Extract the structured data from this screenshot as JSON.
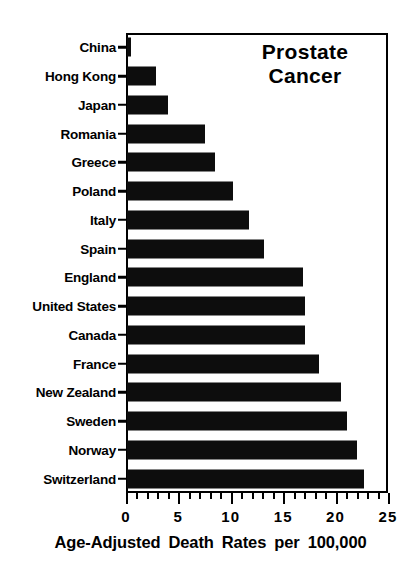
{
  "chart_data": {
    "type": "bar",
    "orientation": "horizontal",
    "title": "Prostate Cancer",
    "title_lines": [
      "Prostate",
      "Cancer"
    ],
    "xlabel": "Age-Adjusted Death Rates per 100,000",
    "ylabel": "",
    "xlim": [
      0,
      25
    ],
    "xticks": [
      0,
      5,
      10,
      15,
      20,
      25
    ],
    "xtick_labels": [
      "0",
      "5",
      "10",
      "15",
      "20",
      "25"
    ],
    "minor_tick_interval": 1,
    "grid": false,
    "legend": false,
    "bar_color": "#0d0d0d",
    "categories": [
      "China",
      "Hong Kong",
      "Japan",
      "Romania",
      "Greece",
      "Poland",
      "Italy",
      "Spain",
      "England",
      "United States",
      "Canada",
      "France",
      "New Zealand",
      "Sweden",
      "Norway",
      "Switzerland"
    ],
    "values": [
      0.4,
      2.8,
      3.9,
      7.4,
      8.4,
      10.1,
      11.6,
      13.1,
      16.8,
      17.0,
      17.0,
      18.3,
      20.4,
      21.0,
      21.9,
      22.6
    ]
  },
  "caption": {
    "words": [
      "Age-Adjusted",
      "Death",
      "Rates",
      "per",
      "100,000"
    ]
  }
}
